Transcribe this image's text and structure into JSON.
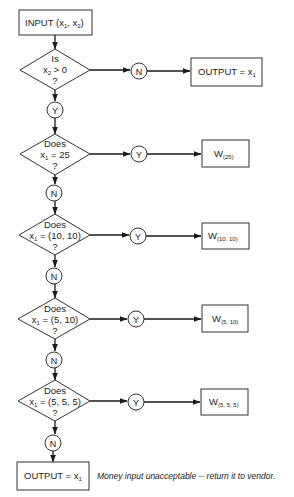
{
  "flowchart": {
    "input": {
      "label": "INPUT (x",
      "sub1": "1",
      "mid": ", x",
      "sub2": "2",
      "end": ")"
    },
    "decisions": [
      {
        "line1": "Is",
        "line2_pre": "x",
        "line2_sub": "2",
        "line2_post": " > 0",
        "line3": "?"
      },
      {
        "line1": "Does",
        "line2_pre": "x",
        "line2_sub": "1",
        "line2_post": " = 25",
        "line3": "?"
      },
      {
        "line1": "Does",
        "line2_pre": "x",
        "line2_sub": "1",
        "line2_post": " = (10, 10)",
        "line3": "?"
      },
      {
        "line1": "Does",
        "line2_pre": "x",
        "line2_sub": "1",
        "line2_post": " = (5, 10)",
        "line3": "?"
      },
      {
        "line1": "Does",
        "line2_pre": "x",
        "line2_sub": "1",
        "line2_post": " = (5, 5, 5)",
        "line3": "?"
      }
    ],
    "connectors": {
      "yes": "Y",
      "no": "N"
    },
    "outputs": [
      {
        "pre": "OUTPUT = x",
        "sub": "1"
      },
      {
        "pre": "W",
        "sub": "(25)"
      },
      {
        "pre": "W",
        "sub": "(10, 10)"
      },
      {
        "pre": "W",
        "sub": "(5, 10)"
      },
      {
        "pre": "W",
        "sub": "(5, 5, 5)"
      },
      {
        "pre": "OUTPUT = x",
        "sub": "1"
      }
    ],
    "caption": "Money input unacceptable -- return it to vendor."
  },
  "colors": {
    "stroke": "#333333",
    "text": "#222222",
    "background": "#ffffff"
  }
}
